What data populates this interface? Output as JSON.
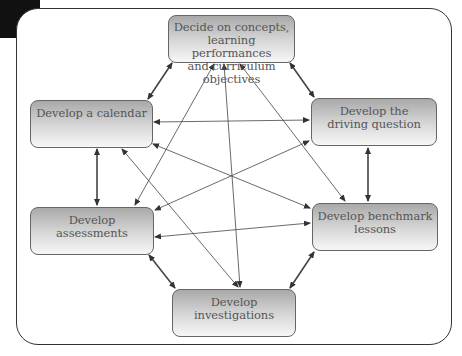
{
  "diagram": {
    "type": "cycle-network",
    "nodes": [
      {
        "id": "objectives",
        "lines": [
          "Decide on concepts,",
          "learning performances",
          "and curriculum objectives"
        ]
      },
      {
        "id": "calendar",
        "lines": [
          "Develop a calendar"
        ]
      },
      {
        "id": "driving_question",
        "lines": [
          "Develop the",
          "driving question"
        ]
      },
      {
        "id": "assessments",
        "lines": [
          "Develop",
          "assessments"
        ]
      },
      {
        "id": "benchmark",
        "lines": [
          "Develop benchmark",
          "lessons"
        ]
      },
      {
        "id": "investigations",
        "lines": [
          "Develop",
          "investigations"
        ]
      }
    ],
    "edges": [
      {
        "from": "objectives",
        "to": "calendar",
        "style": "double-arrow-bold"
      },
      {
        "from": "objectives",
        "to": "driving_question",
        "style": "double-arrow-bold"
      },
      {
        "from": "calendar",
        "to": "assessments",
        "style": "double-arrow-bold"
      },
      {
        "from": "driving_question",
        "to": "benchmark",
        "style": "double-arrow-bold"
      },
      {
        "from": "assessments",
        "to": "investigations",
        "style": "double-arrow-bold"
      },
      {
        "from": "benchmark",
        "to": "investigations",
        "style": "double-arrow-bold"
      },
      {
        "from": "calendar",
        "to": "driving_question",
        "style": "double-arrow"
      },
      {
        "from": "assessments",
        "to": "benchmark",
        "style": "double-arrow"
      },
      {
        "from": "objectives",
        "to": "assessments",
        "style": "double-arrow"
      },
      {
        "from": "objectives",
        "to": "investigations",
        "style": "double-arrow"
      },
      {
        "from": "objectives",
        "to": "benchmark",
        "style": "double-arrow"
      },
      {
        "from": "calendar",
        "to": "benchmark",
        "style": "double-arrow"
      },
      {
        "from": "calendar",
        "to": "investigations",
        "style": "double-arrow"
      },
      {
        "from": "driving_question",
        "to": "assessments",
        "style": "double-arrow"
      }
    ]
  }
}
